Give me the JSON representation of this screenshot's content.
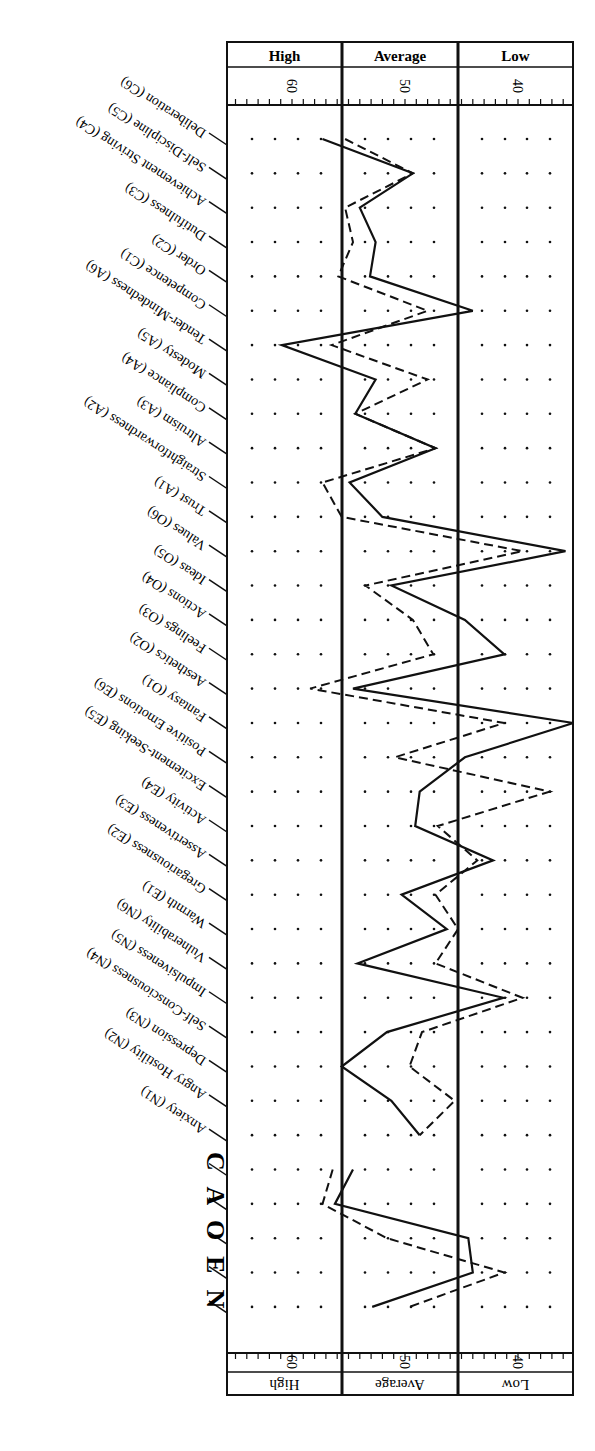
{
  "chart_data": {
    "type": "line",
    "title": "",
    "orientation": "rotated (score axis horizontal, facets vertical)",
    "score_axis": {
      "label": "T-score",
      "direction": "decreasing left to right",
      "range": [
        65.8,
        34.7
      ],
      "ticks": [
        60,
        50,
        40
      ],
      "bands": [
        {
          "label": "High",
          "from": 65.8,
          "to": 55
        },
        {
          "label": "Average",
          "from": 55,
          "to": 45
        },
        {
          "label": "Low",
          "from": 45,
          "to": 34.7
        }
      ]
    },
    "categories": [
      "Deliberation (C6)",
      "Self-Discipline (C5)",
      "Achievement Striving (C4)",
      "Dutifulness (C3)",
      "Order (C2)",
      "Competence (C1)",
      "Tender-Mindedness (A6)",
      "Modesty (A5)",
      "Compliance (A4)",
      "Altruism (A3)",
      "Straightforwardness (A2)",
      "Trust (A1)",
      "Values (O6)",
      "Ideas (O5)",
      "Actions (O4)",
      "Feelings (O3)",
      "Aesthetics (O2)",
      "Fantasy (O1)",
      "Positive Emotions (E6)",
      "Excitement-Seeking (E5)",
      "Activity (E4)",
      "Assertiveness (E3)",
      "Gregariousness (E2)",
      "Warmth (E1)",
      "Vulnerability (N6)",
      "Impulsiveness (N5)",
      "Self-Consciousness (N4)",
      "Depression (N3)",
      "Angry Hostility (N2)",
      "Anxiety (N1)",
      "C",
      "A",
      "O",
      "E",
      "N"
    ],
    "series": [
      {
        "name": "Solid line",
        "style": "solid",
        "values": [
          57.3,
          49.3,
          54.0,
          52.6,
          53.1,
          44.0,
          60.9,
          52.6,
          54.4,
          47.3,
          54.9,
          52.0,
          35.8,
          51.2,
          44.7,
          41.2,
          54.6,
          35.1,
          44.7,
          48.7,
          49.1,
          42.2,
          50.3,
          46.3,
          54.2,
          41.3,
          51.6,
          55.6,
          51.2,
          48.7,
          54.6,
          56.2,
          44.4,
          44.0,
          52.9
        ]
      },
      {
        "name": "Dashed line",
        "style": "dashed",
        "values": [
          55.3,
          49.3,
          55.3,
          54.6,
          55.9,
          48.0,
          56.5,
          48.0,
          54.4,
          47.3,
          57.3,
          55.6,
          39.6,
          53.5,
          49.3,
          47.5,
          58.4,
          41.2,
          50.9,
          37.2,
          47.1,
          43.6,
          47.3,
          45.3,
          47.3,
          39.6,
          48.5,
          49.6,
          45.6,
          48.7,
          56.4,
          57.3,
          51.6,
          41.2,
          49.6
        ]
      }
    ],
    "domain_labels": [
      "N",
      "E",
      "O",
      "A",
      "C"
    ],
    "grid": "dotted",
    "legend": "none"
  },
  "header_top": {
    "bands": [
      "High",
      "Average",
      "Low"
    ],
    "ticks": [
      "60",
      "50",
      "40"
    ]
  },
  "header_bottom": {
    "bands": [
      "High",
      "Average",
      "Low"
    ],
    "ticks": [
      "60",
      "50",
      "40"
    ]
  },
  "domain_title": "N E O A C"
}
